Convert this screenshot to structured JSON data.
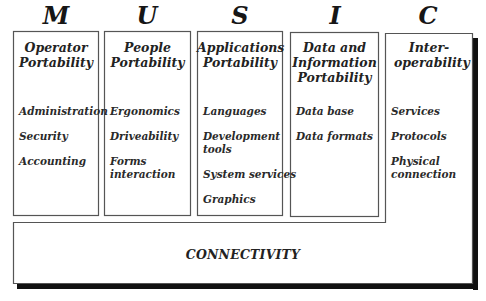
{
  "diagram": {
    "columns": [
      {
        "letter": "M",
        "title": "Operator Portability",
        "items": [
          "Administration",
          "Security",
          "Accounting"
        ]
      },
      {
        "letter": "U",
        "title": "People Portability",
        "items": [
          "Ergonomics",
          "Driveability",
          "Forms interaction"
        ]
      },
      {
        "letter": "S",
        "title": "Applications Portability",
        "items": [
          "Languages",
          "Development tools",
          "System services",
          "Graphics"
        ]
      },
      {
        "letter": "I",
        "title": "Data and Information Portability",
        "items": [
          "Data base",
          "Data formats"
        ]
      },
      {
        "letter": "C",
        "title": "Inter-operability",
        "items": [
          "Services",
          "Protocols",
          "Physical connection"
        ]
      }
    ],
    "base": {
      "label": "CONNECTIVITY"
    },
    "colors": {
      "border": "#555555",
      "shadow": "#111111",
      "background": "#ffffff"
    }
  }
}
